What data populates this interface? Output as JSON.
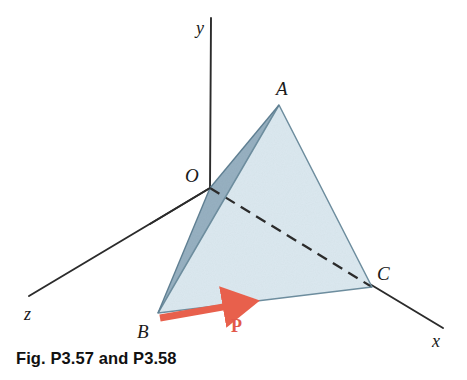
{
  "figure": {
    "caption": "Fig. P3.57 and P3.58",
    "type": "engineering-mechanics-diagram"
  },
  "axes": {
    "y": {
      "label": "y",
      "label_x": 196,
      "label_y": 34,
      "from": [
        210,
        188
      ],
      "to": [
        211,
        18
      ]
    },
    "x": {
      "label": "x",
      "label_x": 432,
      "label_y": 347,
      "from": [
        210,
        188
      ],
      "to": [
        443,
        328
      ]
    },
    "z": {
      "label": "z",
      "label_x": 24,
      "label_y": 320,
      "from": [
        210,
        188
      ],
      "to": [
        29,
        296
      ]
    }
  },
  "vertices": [
    {
      "name": "O",
      "label": "O",
      "x": 210,
      "y": 188,
      "label_x": 185,
      "label_y": 182
    },
    {
      "name": "A",
      "label": "A",
      "x": 279,
      "y": 105,
      "label_x": 276,
      "label_y": 95
    },
    {
      "name": "B",
      "label": "B",
      "x": 158,
      "y": 313,
      "label_x": 137,
      "label_y": 338
    },
    {
      "name": "C",
      "label": "C",
      "x": 372,
      "y": 287,
      "label_x": 377,
      "label_y": 280
    }
  ],
  "faces": {
    "front_ABC": {
      "points": "279,105 158,313 372,287",
      "fill": "#dbe8ef"
    },
    "left_OAB": {
      "points": "210,188 279,105 158,313",
      "fill": "#97b0c1"
    }
  },
  "edges": [
    {
      "name": "edge-A-B",
      "from": [
        279,
        105
      ],
      "to": [
        158,
        313
      ]
    },
    {
      "name": "edge-A-C",
      "from": [
        279,
        105
      ],
      "to": [
        372,
        287
      ]
    },
    {
      "name": "edge-B-C",
      "from": [
        158,
        313
      ],
      "to": [
        372,
        287
      ]
    },
    {
      "name": "edge-O-A",
      "from": [
        210,
        188
      ],
      "to": [
        279,
        105
      ]
    },
    {
      "name": "edge-O-B",
      "from": [
        210,
        188
      ],
      "to": [
        158,
        313
      ]
    }
  ],
  "hidden_edge": {
    "name": "edge-O-C",
    "from": [
      210,
      188
    ],
    "to": [
      372,
      287
    ],
    "dash": "11 7"
  },
  "vector": {
    "label": "P",
    "label_x": 231,
    "label_y": 332,
    "from": [
      160,
      318
    ],
    "to": [
      246,
      303
    ],
    "color": "#e8604c",
    "shaft_width": 7
  },
  "colors": {
    "line": "#2b2b2b",
    "face_front": "#dbe8ef",
    "face_left": "#97b0c1",
    "vector_red": "#e8604c",
    "text": "#1a1a1a",
    "background": "#ffffff"
  }
}
